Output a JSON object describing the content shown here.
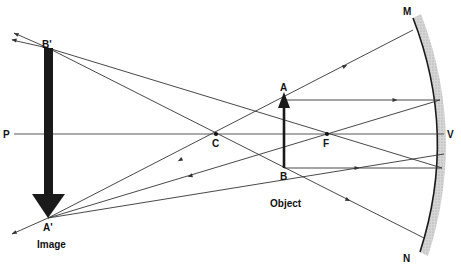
{
  "diagram": {
    "labels": {
      "point_P": "P",
      "point_C": "C",
      "point_F": "F",
      "point_V": "V",
      "point_M": "M",
      "point_N": "N",
      "point_A": "A",
      "point_B": "B",
      "point_A_prime": "A'",
      "point_B_prime": "B'"
    },
    "captions": {
      "object": "Object",
      "image": "Image"
    },
    "colors": {
      "ray": "#333333",
      "mirror_line": "#1a1a1a",
      "mirror_hatch": "#c8c8c8",
      "arrow": "#1a1a1a"
    }
  }
}
